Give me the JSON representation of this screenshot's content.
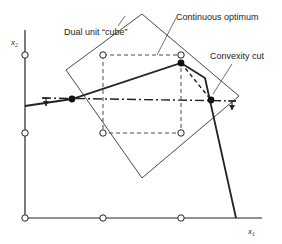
{
  "figure": {
    "type": "integer-programming-geometry",
    "labels": {
      "dual_cube": "Dual unit “cube”",
      "continuous_optimum": "Continuous optimum",
      "convexity_cut": "Convexity cut",
      "x_axis": "x",
      "x_axis_sub": "1",
      "y_axis": "x",
      "y_axis_sub": "2"
    },
    "colors": {
      "ink": "#222222",
      "background": "#ffffff"
    },
    "lattice_points": [
      [
        25,
        55
      ],
      [
        25,
        133
      ],
      [
        25,
        218
      ],
      [
        103,
        55
      ],
      [
        103,
        133
      ],
      [
        103,
        218
      ],
      [
        181,
        55
      ],
      [
        181,
        133
      ],
      [
        181,
        218
      ]
    ],
    "diamond": [
      [
        142,
        14
      ],
      [
        239,
        96
      ],
      [
        142,
        178
      ],
      [
        66,
        70
      ]
    ],
    "dashed_square": [
      [
        103,
        55
      ],
      [
        181,
        55
      ],
      [
        181,
        133
      ],
      [
        103,
        133
      ]
    ],
    "constraint_polyline": [
      [
        25,
        106
      ],
      [
        72,
        99
      ],
      [
        181,
        63
      ],
      [
        205,
        78
      ],
      [
        236,
        218
      ]
    ],
    "solid_points": [
      [
        72,
        99
      ],
      [
        181,
        63
      ],
      [
        211,
        100
      ]
    ],
    "dashed_segment": [
      [
        205,
        78
      ],
      [
        211,
        100
      ]
    ],
    "cut_line": [
      [
        42,
        98
      ],
      [
        236,
        101
      ]
    ]
  }
}
